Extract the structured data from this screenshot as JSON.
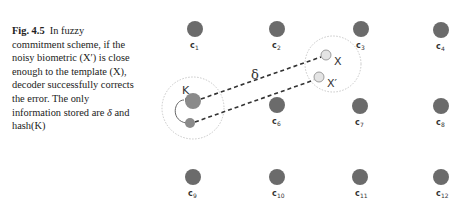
{
  "caption": {
    "figure_label": "Fig. 4.5",
    "lines": [
      "In fuzzy",
      "commitment scheme, if the",
      "noisy biometric (X′) is close",
      "enough to the template (X),",
      "decoder successfully corrects",
      "the error. The only",
      "information stored are ",
      "hash(K)"
    ],
    "delta_symbol": "δ",
    "and_text": " and"
  },
  "diagram": {
    "codewords": [
      {
        "name": "c",
        "sub": "1"
      },
      {
        "name": "c",
        "sub": "2"
      },
      {
        "name": "c",
        "sub": "3"
      },
      {
        "name": "c",
        "sub": "4"
      },
      {
        "name": "c",
        "sub": "6"
      },
      {
        "name": "c",
        "sub": "7"
      },
      {
        "name": "c",
        "sub": "8"
      },
      {
        "name": "c",
        "sub": "9"
      },
      {
        "name": "c",
        "sub": "10"
      },
      {
        "name": "c",
        "sub": "11"
      },
      {
        "name": "c",
        "sub": "12"
      }
    ],
    "labels": {
      "key": "K",
      "template": "X",
      "noisy": "X′",
      "offset": "δ"
    },
    "colors": {
      "codeword": "#6b6b6b",
      "key": "#8a8a8a",
      "biometric": "#e4e4e4",
      "dotted_circle": "#c8c8c8",
      "dashed_line": "#333333"
    }
  }
}
